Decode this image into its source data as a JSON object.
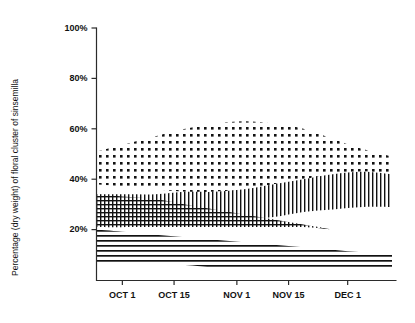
{
  "chart_data": {
    "type": "area",
    "title": "",
    "subtitle": "",
    "xlabel": "",
    "ylabel": "Percentage (dry weight) of floral cluster of sinsemilla",
    "ylim": [
      0,
      100
    ],
    "ytick_labels": [
      "100%",
      "80%",
      "60%",
      "40%",
      "20%"
    ],
    "ytick_values": [
      100,
      80,
      60,
      40,
      20
    ],
    "xtick_labels": [
      "OCT 1",
      "OCT 15",
      "NOV 1",
      "NOV 15",
      "DEC 1"
    ],
    "xtick_values": [
      7,
      21,
      38,
      52,
      68
    ],
    "xlim": [
      0,
      80
    ],
    "grid": false,
    "legend_position": "none",
    "x": [
      0,
      8,
      16,
      24,
      32,
      40,
      48,
      56,
      64,
      72,
      80
    ],
    "series": [
      {
        "name": "upper-dotted-band",
        "pattern": "dots",
        "upper_values": [
          51,
          54,
          57,
          60,
          62,
          63,
          62,
          60,
          56,
          52,
          49
        ],
        "lower_values": [
          38,
          37,
          36,
          35,
          35,
          36,
          38,
          40,
          42,
          43,
          42
        ]
      },
      {
        "name": "middle-vertical-line-band",
        "pattern": "vertical-lines",
        "upper_values": [
          34,
          34,
          34,
          35,
          35,
          36,
          38,
          40,
          42,
          43,
          42
        ],
        "lower_values": [
          21,
          21,
          22,
          22,
          23,
          24,
          25,
          27,
          28,
          29,
          29
        ]
      },
      {
        "name": "lower-crosshatch-band",
        "pattern": "crosshatch",
        "upper_values": [
          34,
          33,
          32,
          30,
          28,
          26,
          24,
          22,
          20,
          0,
          0
        ],
        "lower_values": [
          21,
          21,
          21,
          21,
          21,
          21,
          21,
          21,
          20,
          0,
          0
        ]
      },
      {
        "name": "bottom-horizontal-line-band",
        "pattern": "horizontal-lines",
        "upper_values": [
          20,
          19,
          18,
          17,
          16,
          15,
          14,
          13,
          12,
          11,
          11
        ],
        "lower_values": [
          7,
          7,
          6,
          6,
          5,
          5,
          5,
          4,
          4,
          4,
          4
        ]
      }
    ]
  },
  "axis": {
    "y_title": "Percentage (dry weight) of floral cluster of sinsemilla"
  }
}
